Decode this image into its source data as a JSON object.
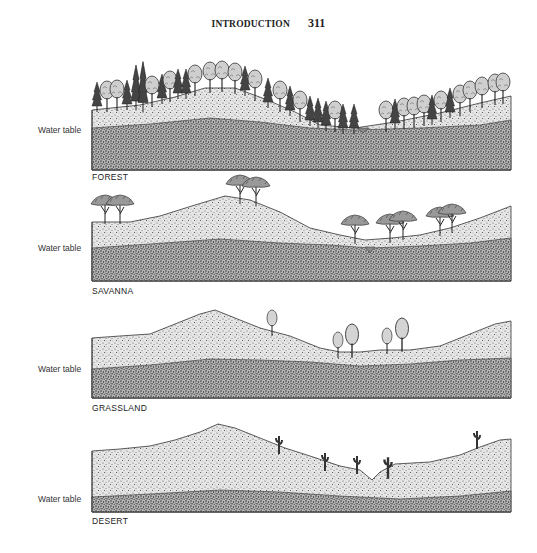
{
  "header": {
    "title": "INTRODUCTION",
    "page_number": "311"
  },
  "figure": {
    "panels": [
      {
        "id": "forest",
        "label": "FOREST",
        "water_table_label": "Water table"
      },
      {
        "id": "savanna",
        "label": "SAVANNA",
        "water_table_label": "Water table"
      },
      {
        "id": "grassland",
        "label": "GRASSLAND",
        "water_table_label": "Water table"
      },
      {
        "id": "desert",
        "label": "DESERT",
        "water_table_label": "Water table"
      }
    ]
  }
}
